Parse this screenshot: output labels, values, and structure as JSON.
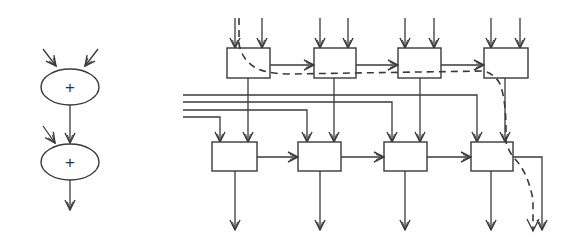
{
  "diagram": {
    "left": {
      "title": "adder-chain",
      "nodes": [
        {
          "id": "add1",
          "label": "+",
          "cx": 70,
          "cy": 87,
          "rx": 29,
          "ry": 18
        },
        {
          "id": "add2",
          "label": "+",
          "cx": 70,
          "cy": 162,
          "rx": 29,
          "ry": 18
        }
      ]
    },
    "right": {
      "title": "systolic-array",
      "top_row": [
        {
          "id": "t1",
          "x": 227,
          "y": 48,
          "w": 43,
          "h": 30
        },
        {
          "id": "t2",
          "x": 314,
          "y": 48,
          "w": 42,
          "h": 30
        },
        {
          "id": "t3",
          "x": 398,
          "y": 48,
          "w": 43,
          "h": 30
        },
        {
          "id": "t4",
          "x": 484,
          "y": 48,
          "w": 44,
          "h": 30
        }
      ],
      "bottom_row": [
        {
          "id": "b1",
          "x": 212,
          "y": 142,
          "w": 45,
          "h": 29
        },
        {
          "id": "b2",
          "x": 298,
          "y": 142,
          "w": 43,
          "h": 29
        },
        {
          "id": "b3",
          "x": 384,
          "y": 142,
          "w": 43,
          "h": 29
        },
        {
          "id": "b4",
          "x": 471,
          "y": 142,
          "w": 42,
          "h": 29
        }
      ],
      "bus_lines": [
        {
          "y": 95,
          "x_start": 183,
          "x_end": 477
        },
        {
          "y": 102,
          "x_start": 183,
          "x_end": 392
        },
        {
          "y": 110,
          "x_start": 183,
          "x_end": 307
        },
        {
          "y": 117,
          "x_start": 183,
          "x_end": 220
        }
      ],
      "dashed_path": "critical-path",
      "colors": {
        "line": "#3a3a3a",
        "background": "#ffffff"
      }
    }
  }
}
